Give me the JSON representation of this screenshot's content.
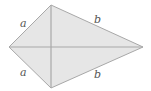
{
  "diagram": {
    "shape": "kite",
    "fill_color": "#e6e6e6",
    "stroke_color": "#a8a8a8",
    "vertices": {
      "left": [
        9,
        47
      ],
      "top": [
        51,
        5
      ],
      "right": [
        143,
        47
      ],
      "bottom": [
        51,
        88
      ]
    },
    "labels": {
      "top_left": "a",
      "top_right": "b",
      "bottom_left": "a",
      "bottom_right": "b"
    }
  }
}
